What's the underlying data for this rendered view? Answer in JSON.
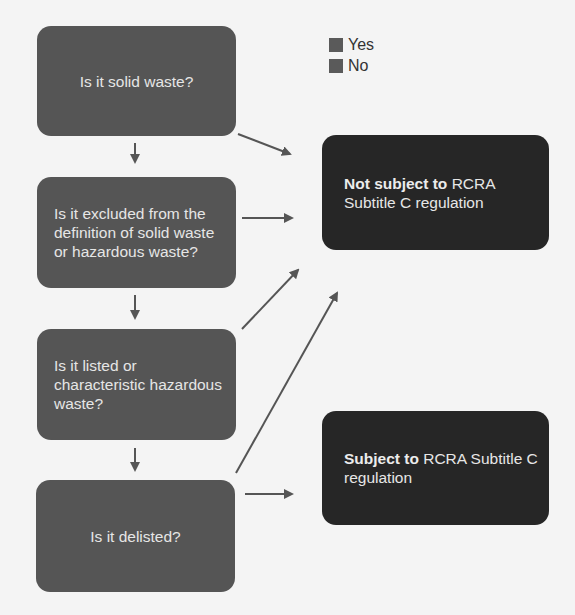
{
  "legend": {
    "items": [
      {
        "label": "Yes",
        "color": "#555555"
      },
      {
        "label": "No",
        "color": "#555555"
      }
    ]
  },
  "questions": [
    {
      "id": "q1",
      "text": "Is it solid waste?"
    },
    {
      "id": "q2",
      "text": "Is it excluded from the definition of solid waste or hazardous waste?"
    },
    {
      "id": "q3",
      "text": "Is it listed or characteristic hazardous waste?"
    },
    {
      "id": "q4",
      "text": "Is it delisted?"
    }
  ],
  "results": [
    {
      "id": "not-subject",
      "bold": "Not subject to",
      "rest": " RCRA Subtitle C regulation"
    },
    {
      "id": "subject",
      "bold": "Subject to",
      "rest": " RCRA Subtitle C regulation"
    }
  ],
  "colors": {
    "question_fill": "#555555",
    "result_fill": "#262626",
    "arrow": "#555555",
    "background": "#f4f4f4"
  }
}
